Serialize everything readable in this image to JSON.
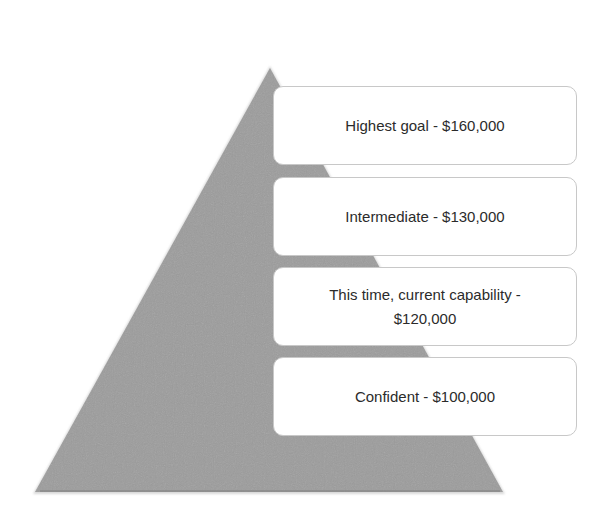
{
  "diagram": {
    "type": "pyramid",
    "shape_color": "#9c9c9c",
    "box_border_color": "#c8c8c8",
    "text_color": "#2b2b2b",
    "levels": [
      {
        "label": "Highest goal - $160,000",
        "amount": 160000
      },
      {
        "label": "Intermediate - $130,000",
        "amount": 130000
      },
      {
        "label": "This time, current capability - $120,000",
        "amount": 120000
      },
      {
        "label": "Confident - $100,000",
        "amount": 100000
      }
    ]
  }
}
